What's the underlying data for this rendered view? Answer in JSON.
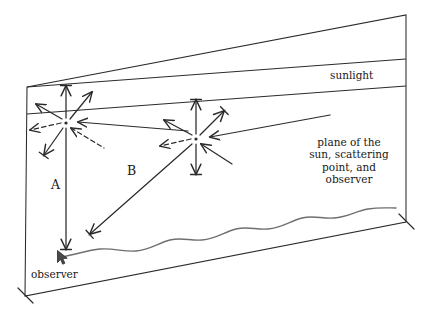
{
  "figure": {
    "type": "diagram",
    "stroke_color": "#2b2b2b",
    "background_color": "#ffffff"
  },
  "labels": {
    "sunlight": "sunlight",
    "plane_note": "plane of the\nsun, scattering\npoint, and\nobserver",
    "plane_note_lines": [
      "plane of the",
      "sun, scattering",
      "point, and",
      "observer"
    ],
    "observer": "observer",
    "ray_a": "A",
    "ray_b": "B"
  },
  "geometry": {
    "plane_outline": [
      [
        27,
        87
      ],
      [
        406,
        15
      ],
      [
        406,
        222
      ],
      [
        25,
        296
      ]
    ],
    "band_line_upper": [
      [
        27,
        87
      ],
      [
        406,
        59
      ]
    ],
    "band_line_lower": [
      [
        27,
        114
      ],
      [
        406,
        86
      ]
    ],
    "scatter_point_left": [
      66,
      123
    ],
    "scatter_point_right": [
      196,
      139
    ],
    "observer_point": [
      60,
      258
    ],
    "ray_a_end": [
      66,
      249
    ],
    "ray_b_end": [
      90,
      234
    ],
    "horizon_start": [
      62,
      257
    ],
    "horizon_end": [
      396,
      208
    ]
  },
  "elements": {
    "scatter_rays_per_point": 8,
    "dashed_ray_directions": [
      "left",
      "lower-left"
    ],
    "incoming_ray_direction": "from-right-horizontal",
    "vertical_double_arrow": true
  }
}
